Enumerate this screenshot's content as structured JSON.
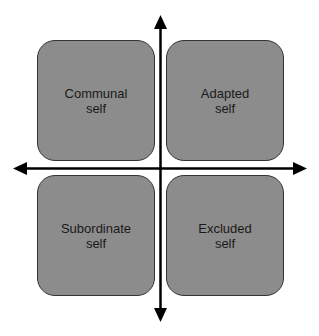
{
  "quadrants": [
    {
      "position": "top-left",
      "label": "Communal\nself"
    },
    {
      "position": "top-right",
      "label": "Adapted\nself"
    },
    {
      "position": "bottom-left",
      "label": "Subordinate\nself"
    },
    {
      "position": "bottom-right",
      "label": "Excluded\nself"
    }
  ],
  "colors": {
    "box_fill": "#8c8c8c",
    "axis": "#000000"
  }
}
